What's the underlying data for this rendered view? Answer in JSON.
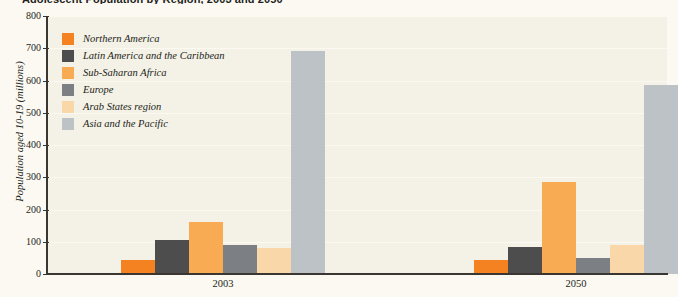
{
  "chart_data": {
    "type": "bar",
    "title": "Adolescent Population by Region, 2003 and 2050",
    "xlabel": "",
    "ylabel": "Population aged 10-19 (millions)",
    "categories": [
      "2003",
      "2050"
    ],
    "ylim": [
      0,
      800
    ],
    "yticks": [
      0,
      100,
      200,
      300,
      400,
      500,
      600,
      700,
      800
    ],
    "grid": true,
    "legend_position": "upper-left",
    "series": [
      {
        "name": "Northern America",
        "color": "#f58220",
        "values": [
          45,
          45
        ]
      },
      {
        "name": "Latin America and the Caribbean",
        "color": "#4d4d4d",
        "values": [
          105,
          85
        ]
      },
      {
        "name": "Sub-Saharan Africa",
        "color": "#f9ab54",
        "values": [
          162,
          285
        ]
      },
      {
        "name": "Europe",
        "color": "#7c7f83",
        "values": [
          90,
          50
        ]
      },
      {
        "name": "Arab States region",
        "color": "#fad7a8",
        "values": [
          80,
          90
        ]
      },
      {
        "name": "Asia and the Pacific",
        "color": "#bcc2c6",
        "values": [
          690,
          585
        ]
      }
    ]
  },
  "style": {
    "plot_background": "#f4f1e6",
    "page_background": "#fbf9f2",
    "axis_color": "#3a3632",
    "gridline_color": "#fbf9f2",
    "text_color": "#231f20"
  }
}
